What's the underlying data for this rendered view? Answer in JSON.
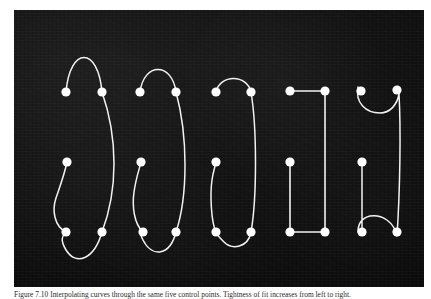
{
  "figure": {
    "plate": {
      "background_color": "#0d0d0d",
      "stroke_color": "#f2f2f2",
      "dot_color": "#ffffff",
      "width": 410,
      "height": 277,
      "shape_count": 5
    },
    "caption": {
      "label": "Figure 7.10",
      "text": "Figure 7.10  Interpolating curves through the same five control points. Tightness of fit increases from left to right."
    },
    "shapes": [
      {
        "name": "shape-1-loose-spline",
        "index": 1,
        "style": "loose overshooting spline",
        "points": [
          {
            "id": "p1",
            "x": 52,
            "y": 82
          },
          {
            "id": "p2",
            "x": 88,
            "y": 82
          },
          {
            "id": "p3",
            "x": 53,
            "y": 152
          },
          {
            "id": "p4",
            "x": 52,
            "y": 222
          },
          {
            "id": "p5",
            "x": 88,
            "y": 222
          }
        ],
        "path": "M 52 82 C 56 36, 84 36, 88 82 C 104 128, 104 180, 88 222 C 80 250, 62 256, 52 240 C 46 230, 48 226, 52 222 C 40 216, 38 200, 42 188 C 46 176, 50 166, 53 152"
      },
      {
        "name": "shape-2-oval-spline",
        "index": 2,
        "style": "oval spline",
        "points": [
          {
            "id": "p1",
            "x": 126,
            "y": 82
          },
          {
            "id": "p2",
            "x": 162,
            "y": 82
          },
          {
            "id": "p3",
            "x": 127,
            "y": 152
          },
          {
            "id": "p4",
            "x": 129,
            "y": 222
          },
          {
            "id": "p5",
            "x": 162,
            "y": 222
          }
        ],
        "path": "M 126 82 C 130 52, 158 52, 162 82 C 174 126, 174 186, 162 222 C 156 246, 138 248, 129 230 C 126 224, 126 223, 129 222 C 120 214, 118 196, 120 182 C 122 168, 125 160, 127 152"
      },
      {
        "name": "shape-3-rounded-rectangle-spline",
        "index": 3,
        "style": "rounded rectangle spline",
        "points": [
          {
            "id": "p1",
            "x": 202,
            "y": 82
          },
          {
            "id": "p2",
            "x": 237,
            "y": 82
          },
          {
            "id": "p3",
            "x": 202,
            "y": 152
          },
          {
            "id": "p4",
            "x": 202,
            "y": 222
          },
          {
            "id": "p5",
            "x": 237,
            "y": 222
          }
        ],
        "path": "M 202 82 C 206 64, 233 64, 237 82 C 243 118, 243 188, 237 222 C 234 238, 218 240, 210 232 C 205 227, 202 224, 202 222 C 197 212, 196 184, 198 170 C 199 162, 201 157, 202 152"
      },
      {
        "name": "shape-4-straight-polyline",
        "index": 4,
        "style": "straight polyline / sharp corners",
        "points": [
          {
            "id": "p1",
            "x": 276,
            "y": 81
          },
          {
            "id": "p2",
            "x": 311,
            "y": 81
          },
          {
            "id": "p3",
            "x": 276,
            "y": 152
          },
          {
            "id": "p4",
            "x": 276,
            "y": 222
          },
          {
            "id": "p5",
            "x": 311,
            "y": 222
          }
        ],
        "path": "M 276 81 L 311 81 L 311 222 L 276 222 L 276 152"
      },
      {
        "name": "shape-5-tight-inverted-spline",
        "index": 5,
        "style": "tight spline with inverted end tangents",
        "points": [
          {
            "id": "p1",
            "x": 347,
            "y": 81
          },
          {
            "id": "p2",
            "x": 383,
            "y": 80
          },
          {
            "id": "p3",
            "x": 348,
            "y": 152
          },
          {
            "id": "p4",
            "x": 348,
            "y": 222
          },
          {
            "id": "p5",
            "x": 383,
            "y": 222
          }
        ],
        "path": "M 344 77 C 341 93, 352 103, 366 103 C 376 103, 383 95, 385 84 C 387 120, 386 180, 383 226 M 383 226 C 380 212, 368 204, 356 206 C 348 208, 344 214, 344 222 M 348 222 L 348 152"
      }
    ]
  }
}
